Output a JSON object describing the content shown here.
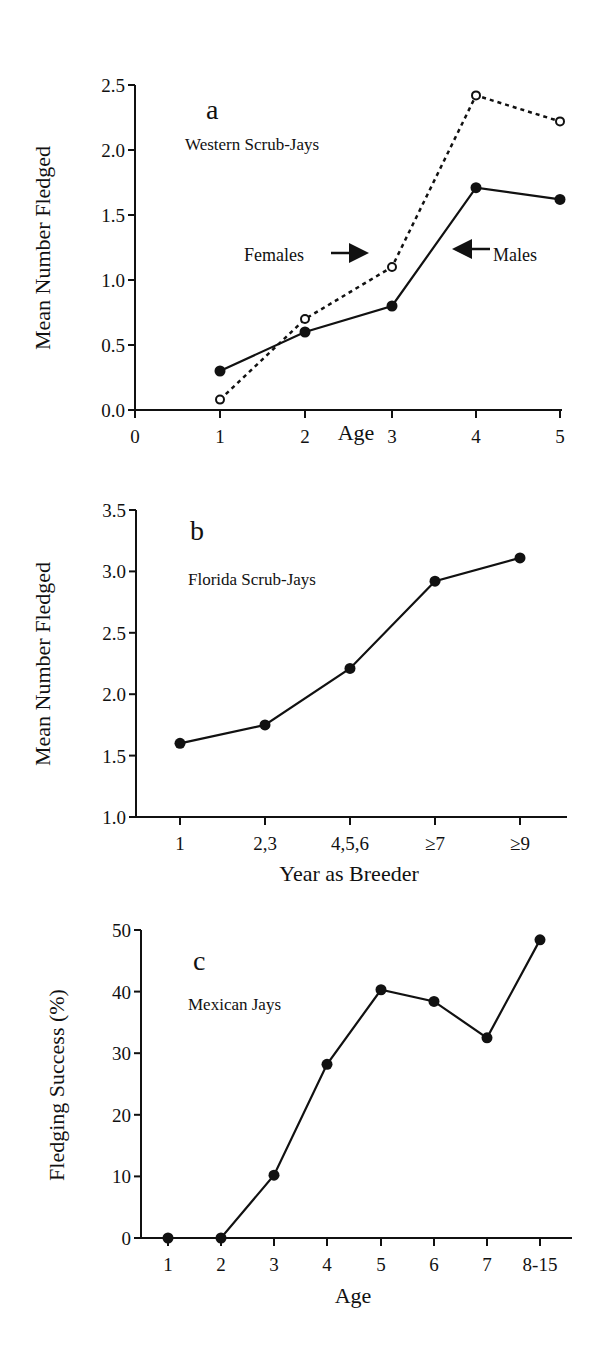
{
  "colors": {
    "ink": "#111111",
    "background": "#ffffff"
  },
  "panels": {
    "a": {
      "letter": "a",
      "species": "Western Scrub-Jays",
      "ylabel": "Mean Number Fledged",
      "xlabel": "Age",
      "yticks": [
        "0.0",
        "0.5",
        "1.0",
        "1.5",
        "2.0",
        "2.5"
      ],
      "xticks": [
        "0",
        "1",
        "2",
        "3",
        "4",
        "5"
      ],
      "annotations": {
        "females": "Females",
        "males": "Males"
      }
    },
    "b": {
      "letter": "b",
      "species": "Florida Scrub-Jays",
      "ylabel": "Mean Number Fledged",
      "xlabel": "Year as Breeder",
      "yticks": [
        "1.0",
        "1.5",
        "2.0",
        "2.5",
        "3.0",
        "3.5"
      ],
      "xticks": [
        "1",
        "2,3",
        "4,5,6",
        "≥7",
        "≥9"
      ]
    },
    "c": {
      "letter": "c",
      "species": "Mexican Jays",
      "ylabel": "Fledging Success (%)",
      "xlabel": "Age",
      "yticks": [
        "0",
        "10",
        "20",
        "30",
        "40",
        "50"
      ],
      "xticks": [
        "1",
        "2",
        "3",
        "4",
        "5",
        "6",
        "7",
        "8-15"
      ]
    }
  },
  "chart_data": [
    {
      "type": "line",
      "title": "a — Western Scrub-Jays",
      "xlabel": "Age",
      "ylabel": "Mean Number Fledged",
      "x": [
        1,
        2,
        3,
        4,
        5
      ],
      "xlim": [
        0,
        5
      ],
      "ylim": [
        0,
        2.5
      ],
      "grid": false,
      "series": [
        {
          "name": "Females",
          "style": "dotted, open circles",
          "values": [
            0.08,
            0.7,
            1.1,
            2.42,
            2.22
          ]
        },
        {
          "name": "Males",
          "style": "solid, filled circles",
          "values": [
            0.3,
            0.6,
            0.8,
            1.71,
            1.62
          ]
        }
      ],
      "annotations": [
        "Females →",
        "← Males"
      ]
    },
    {
      "type": "line",
      "title": "b — Florida Scrub-Jays",
      "xlabel": "Year as Breeder",
      "ylabel": "Mean Number Fledged",
      "categories": [
        "1",
        "2,3",
        "4,5,6",
        "≥7",
        "≥9"
      ],
      "values": [
        1.6,
        1.75,
        2.21,
        2.92,
        3.11
      ],
      "ylim": [
        1.0,
        3.5
      ],
      "grid": false
    },
    {
      "type": "line",
      "title": "c — Mexican Jays",
      "xlabel": "Age",
      "ylabel": "Fledging Success (%)",
      "categories": [
        "1",
        "2",
        "3",
        "4",
        "5",
        "6",
        "7",
        "8-15"
      ],
      "values": [
        0,
        0,
        10.2,
        28.2,
        40.3,
        38.4,
        32.5,
        48.4
      ],
      "ylim": [
        0,
        50
      ],
      "grid": false
    }
  ]
}
